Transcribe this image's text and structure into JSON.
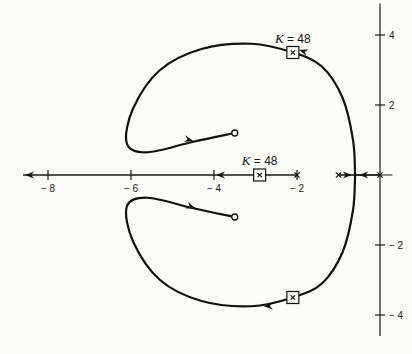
{
  "chart_data": {
    "type": "root-locus",
    "title": "",
    "xlabel": "",
    "ylabel": "",
    "xlim": [
      -8.6,
      0.3
    ],
    "ylim": [
      -4.6,
      4.9
    ],
    "x_ticks": [
      -8,
      -6,
      -4,
      -2
    ],
    "x_tick_labels": [
      "− 8",
      "− 6",
      "− 4",
      "− 2"
    ],
    "y_ticks": [
      4,
      2,
      -2,
      -4
    ],
    "y_tick_labels": [
      "4",
      "2",
      "− 2",
      "− 4"
    ],
    "poles": [
      [
        0,
        0
      ],
      [
        -1,
        0
      ],
      [
        -2,
        0
      ]
    ],
    "zeros": [
      [
        -3.5,
        1.2
      ],
      [
        -3.5,
        -1.2
      ]
    ],
    "gain_markers": [
      {
        "label_var": "K",
        "label_eq": " = 48",
        "point": [
          -2.9,
          0
        ],
        "label_position": "above"
      },
      {
        "label_var": "K",
        "label_eq": " = 48",
        "point": [
          -2.1,
          3.5
        ],
        "label_position": "above"
      },
      {
        "label_var": "K",
        "label_eq": " = 48",
        "point": [
          -2.1,
          -3.5
        ],
        "label_position": "none"
      }
    ],
    "branches": [
      {
        "name": "real-axis-left",
        "points": [
          [
            -2,
            0
          ],
          [
            -8.6,
            0
          ]
        ],
        "direction": "toward -infinity"
      },
      {
        "name": "real-axis-break-in-from-left",
        "points": [
          [
            -1,
            0
          ],
          [
            -0.6,
            0
          ]
        ]
      },
      {
        "name": "real-axis-break-in-from-origin",
        "points": [
          [
            0,
            0
          ],
          [
            -0.6,
            0
          ]
        ]
      },
      {
        "name": "upper-branch",
        "points": [
          [
            -0.6,
            0
          ],
          [
            -0.65,
            1.0
          ],
          [
            -0.9,
            2.2
          ],
          [
            -1.4,
            3.1
          ],
          [
            -2.1,
            3.5
          ],
          [
            -3.1,
            3.75
          ],
          [
            -4.3,
            3.6
          ],
          [
            -5.3,
            3.0
          ],
          [
            -5.95,
            1.9
          ],
          [
            -6.1,
            0.9
          ],
          [
            -5.6,
            0.65
          ],
          [
            -4.5,
            0.95
          ],
          [
            -3.5,
            1.2
          ]
        ]
      },
      {
        "name": "lower-branch",
        "points": [
          [
            -0.6,
            0
          ],
          [
            -0.65,
            -1.0
          ],
          [
            -0.9,
            -2.2
          ],
          [
            -1.4,
            -3.1
          ],
          [
            -2.1,
            -3.5
          ],
          [
            -3.1,
            -3.75
          ],
          [
            -4.3,
            -3.6
          ],
          [
            -5.3,
            -3.0
          ],
          [
            -5.95,
            -1.9
          ],
          [
            -6.1,
            -0.9
          ],
          [
            -5.6,
            -0.65
          ],
          [
            -4.5,
            -0.95
          ],
          [
            -3.5,
            -1.2
          ]
        ]
      }
    ],
    "grid": false,
    "legend": "none"
  }
}
